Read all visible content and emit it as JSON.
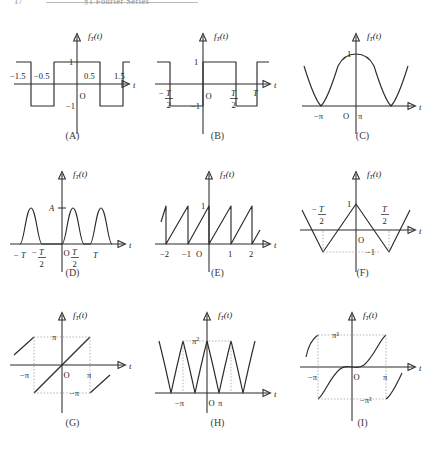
{
  "header": {
    "folio": "17",
    "title": "§1  Fourier Series"
  },
  "axis": {
    "fn_label": "f",
    "fn_sub": "T",
    "fn_arg": "(t)",
    "t_label": "t",
    "origin": "O"
  },
  "panels": [
    {
      "id": "A",
      "caption": "(A)",
      "xticks": [
        "−1.5",
        "−0.5",
        "0.5",
        "1.5"
      ],
      "yticks": [
        "1",
        "−1"
      ],
      "description": "square wave, period 2, amplitude 1"
    },
    {
      "id": "B",
      "caption": "(B)",
      "xticks": [
        "-T/2",
        "T/2",
        "T"
      ],
      "yticks": [
        "1",
        "−1"
      ],
      "description": "square wave, period T, amplitude 1"
    },
    {
      "id": "C",
      "caption": "(C)",
      "xticks": [
        "−π",
        "π"
      ],
      "yticks": [
        "1"
      ],
      "description": "rectified cosine, zeros at ±π"
    },
    {
      "id": "D",
      "caption": "(D)",
      "xticks": [
        "−T",
        "-T/2",
        "T/2",
        "T"
      ],
      "yticks": [
        "A"
      ],
      "description": "half-wave rectified sine, amplitude A, period T"
    },
    {
      "id": "E",
      "caption": "(E)",
      "xticks": [
        "−2",
        "−1",
        "1",
        "2"
      ],
      "yticks": [
        "1"
      ],
      "description": "sawtooth, period 1, rises 0 to 1"
    },
    {
      "id": "F",
      "caption": "(F)",
      "xticks": [
        "-T/2",
        "T/2"
      ],
      "yticks": [
        "1",
        "−1"
      ],
      "description": "triangular wave, peak 1 at t=0, min −1 at ±T/2"
    },
    {
      "id": "G",
      "caption": "(G)",
      "xticks": [
        "−π",
        "π"
      ],
      "yticks": [
        "π",
        "−π"
      ],
      "description": "sawtooth f(t)=t on (−π,π), period 2π"
    },
    {
      "id": "H",
      "caption": "(H)",
      "xticks": [
        "−π",
        "π"
      ],
      "yticks": [
        "π",
        "2"
      ],
      "ylabel": "π²",
      "description": "periodic parabola t², period 2π, peak π²"
    },
    {
      "id": "I",
      "caption": "(I)",
      "xticks": [
        "−π",
        "π"
      ],
      "yticks": [
        "π³",
        "−π³"
      ],
      "description": "periodic cubic t³, period 2π, peaks ±π³"
    }
  ],
  "colors": {
    "ink": "#2b2b2b",
    "guide": "#9a9a9a",
    "rule": "#b9b9b9",
    "background": "#ffffff"
  }
}
